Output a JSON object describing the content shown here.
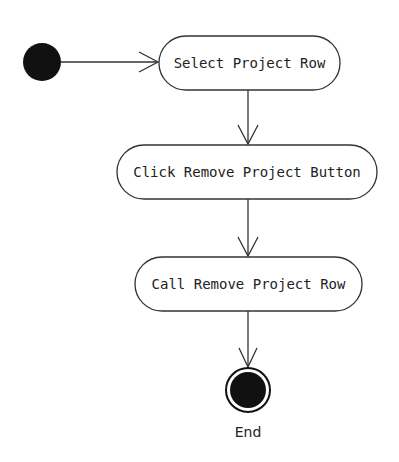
{
  "diagram": {
    "type": "uml-activity",
    "initial_node": {
      "cx": 42,
      "cy": 62,
      "r": 19,
      "color": "#111111"
    },
    "actions": [
      {
        "id": "a1",
        "label": "Select Project Row",
        "x": 159,
        "y": 36,
        "w": 181,
        "h": 54
      },
      {
        "id": "a2",
        "label": "Click Remove Project Button",
        "x": 117,
        "y": 145,
        "w": 260,
        "h": 54
      },
      {
        "id": "a3",
        "label": "Call Remove Project Row",
        "x": 135,
        "y": 257,
        "w": 227,
        "h": 54
      }
    ],
    "final_node": {
      "cx": 248,
      "cy": 390,
      "r_outer": 23,
      "r_inner": 18,
      "label": "End"
    },
    "edges": [
      {
        "from": "initial",
        "to": "a1"
      },
      {
        "from": "a1",
        "to": "a2"
      },
      {
        "from": "a2",
        "to": "a3"
      },
      {
        "from": "a3",
        "to": "final"
      }
    ],
    "colors": {
      "stroke": "#333333",
      "fill_dark": "#111111",
      "background": "#ffffff"
    }
  }
}
